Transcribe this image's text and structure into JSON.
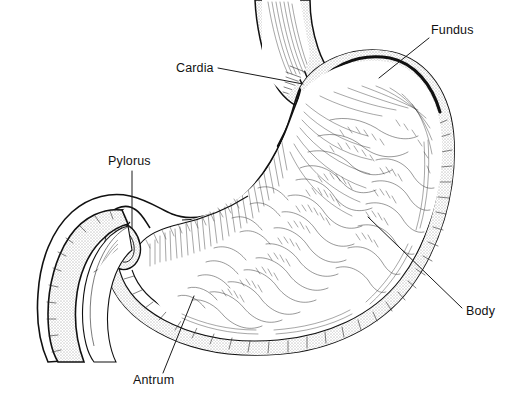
{
  "diagram": {
    "style": "black-and-white pen-and-ink line drawing, cutaway showing rugae",
    "background_color": "#ffffff",
    "ink_color": "#111111",
    "width": 514,
    "height": 400
  },
  "labels": [
    {
      "id": "fundus",
      "text": "Fundus",
      "text_x": 431,
      "text_y": 34,
      "anchor": "start",
      "leader": {
        "x1": 429,
        "y1": 38,
        "x2": 379,
        "y2": 78
      }
    },
    {
      "id": "cardia",
      "text": "Cardia",
      "text_x": 176,
      "text_y": 72,
      "anchor": "start",
      "leader": {
        "x1": 218,
        "y1": 68,
        "x2": 303,
        "y2": 84
      }
    },
    {
      "id": "pylorus",
      "text": "Pylorus",
      "text_x": 108,
      "text_y": 165,
      "anchor": "start",
      "leader": {
        "x1": 132,
        "y1": 171,
        "x2": 132,
        "y2": 228
      }
    },
    {
      "id": "antrum",
      "text": "Antrum",
      "text_x": 133,
      "text_y": 384,
      "anchor": "start",
      "leader": {
        "x1": 163,
        "y1": 373,
        "x2": 194,
        "y2": 296
      }
    },
    {
      "id": "body",
      "text": "Body",
      "text_x": 466,
      "text_y": 315,
      "anchor": "start",
      "leader": {
        "x1": 462,
        "y1": 308,
        "x2": 368,
        "y2": 217
      }
    }
  ],
  "anatomy_parts": [
    {
      "id": "esophagus",
      "name": "Esophagus",
      "labeled": false
    },
    {
      "id": "cardia",
      "name": "Cardia",
      "labeled": true
    },
    {
      "id": "fundus",
      "name": "Fundus",
      "labeled": true
    },
    {
      "id": "body",
      "name": "Body",
      "labeled": true
    },
    {
      "id": "antrum",
      "name": "Antrum",
      "labeled": true
    },
    {
      "id": "pylorus",
      "name": "Pylorus",
      "labeled": true
    },
    {
      "id": "duodenum",
      "name": "Duodenum",
      "labeled": false
    },
    {
      "id": "lesser-curvature",
      "name": "Lesser curvature",
      "labeled": false
    },
    {
      "id": "greater-curvature",
      "name": "Greater curvature",
      "labeled": false
    },
    {
      "id": "rugae",
      "name": "Rugae (mucosal folds)",
      "labeled": false
    }
  ]
}
